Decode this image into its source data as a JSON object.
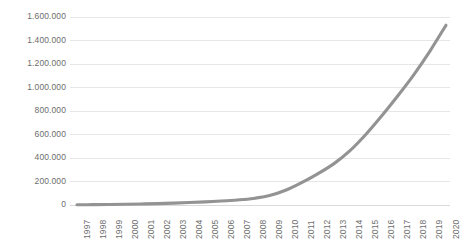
{
  "chart_data": {
    "type": "line",
    "title": "",
    "subtitle": "",
    "xlabel": "",
    "ylabel": "",
    "legend": [],
    "legend_position": "none",
    "grid": true,
    "grid_axis": "y",
    "series_color": "#939393",
    "grid_color": "#e6e6e6",
    "tick_label_color": "#6d6d6d",
    "number_format": "european-dot-thousands",
    "x": [
      "1997",
      "1998",
      "1999",
      "2000",
      "2001",
      "2002",
      "2003",
      "2004",
      "2005",
      "2006",
      "2007",
      "2008",
      "2009",
      "2010",
      "2011",
      "2012",
      "2013",
      "2014",
      "2015",
      "2016",
      "2017",
      "2018",
      "2019",
      "2020"
    ],
    "categories": [
      "1997",
      "1998",
      "1999",
      "2000",
      "2001",
      "2002",
      "2003",
      "2004",
      "2005",
      "2006",
      "2007",
      "2008",
      "2009",
      "2010",
      "2011",
      "2012",
      "2013",
      "2014",
      "2015",
      "2016",
      "2017",
      "2018",
      "2019",
      "2020"
    ],
    "values": [
      2000,
      3000,
      4500,
      6500,
      9000,
      12000,
      16000,
      21000,
      27000,
      34000,
      43000,
      56000,
      80000,
      125000,
      190000,
      265000,
      350000,
      460000,
      600000,
      760000,
      930000,
      1110000,
      1310000,
      1530000
    ],
    "series": [
      {
        "name": "",
        "values": [
          2000,
          3000,
          4500,
          6500,
          9000,
          12000,
          16000,
          21000,
          27000,
          34000,
          43000,
          56000,
          80000,
          125000,
          190000,
          265000,
          350000,
          460000,
          600000,
          760000,
          930000,
          1110000,
          1310000,
          1530000
        ]
      }
    ],
    "ylim": [
      0,
      1600000
    ],
    "ytick_values": [
      0,
      200000,
      400000,
      600000,
      800000,
      1000000,
      1200000,
      1400000,
      1600000
    ],
    "ytick_labels": [
      "0",
      "200.000",
      "400.000",
      "600.000",
      "800.000",
      "1.000.000",
      "1.200.000",
      "1.400.000",
      "1.600.000"
    ],
    "xtick_labels": [
      "1997",
      "1998",
      "1999",
      "2000",
      "2001",
      "2002",
      "2003",
      "2004",
      "2005",
      "2006",
      "2007",
      "2008",
      "2009",
      "2010",
      "2011",
      "2012",
      "2013",
      "2014",
      "2015",
      "2016",
      "2017",
      "2018",
      "2019",
      "2020"
    ]
  }
}
